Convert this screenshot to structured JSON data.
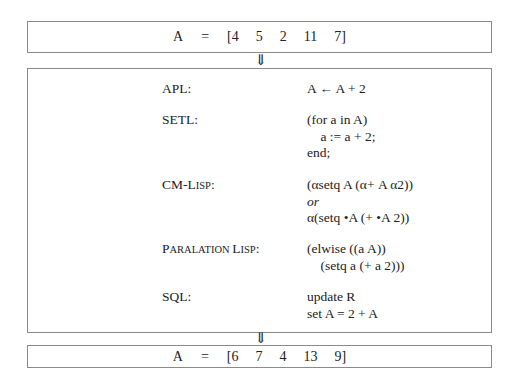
{
  "input": {
    "lhs": "A",
    "eq": "=",
    "values": [
      "[4",
      "5",
      "2",
      "11",
      "7]"
    ]
  },
  "arrow": "⇓",
  "languages": [
    {
      "label": "APL:",
      "code": [
        "A ← A + 2"
      ]
    },
    {
      "label": "SETL:",
      "code": [
        "(for a in A)",
        "    a := a + 2;",
        "end;"
      ]
    },
    {
      "label_parts": [
        "CM-L",
        "ISP",
        ":"
      ],
      "code": [
        "(αsetq A (α+ A α2))",
        "or",
        "α(setq •A (+ •A 2))"
      ]
    },
    {
      "label_parts": [
        "P",
        "ARALATION ",
        "L",
        "ISP",
        ":"
      ],
      "code": [
        "(elwise ((a A))",
        "    (setq a (+ a 2)))"
      ]
    },
    {
      "label": "SQL:",
      "code": [
        "update R",
        "set A = 2 + A"
      ]
    }
  ],
  "output": {
    "lhs": "A",
    "eq": "=",
    "values": [
      "[6",
      "7",
      "4",
      "13",
      "9]"
    ]
  }
}
